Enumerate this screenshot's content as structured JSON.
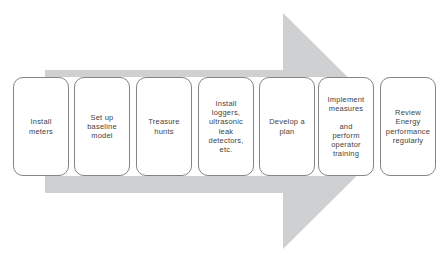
{
  "diagram": {
    "type": "process-flow-arrow",
    "direction": "right",
    "arrow_color": "#cfd0d1",
    "box_fill": "#ffffff",
    "box_border_color": "#848484",
    "text_color": "#3f3f3f",
    "steps": [
      {
        "label": "Install meters",
        "lines": [
          "Install",
          "meters"
        ]
      },
      {
        "label": "Set up baseline model",
        "lines": [
          "Set up",
          "baseline",
          "model"
        ]
      },
      {
        "label": "Treasure hunts",
        "lines": [
          "Treasure",
          "hunts"
        ]
      },
      {
        "label": "Install loggers, ultrasonic leak detectors, etc.",
        "lines": [
          "Install",
          "loggers,",
          "ultrasonic",
          "leak",
          "detectors,",
          "etc."
        ]
      },
      {
        "label": "Develop a plan",
        "lines": [
          "Develop a",
          "plan"
        ]
      },
      {
        "label": "Implement measures and perform operator training",
        "lines": [
          "Implement",
          "measures",
          "",
          "and",
          "perform",
          "operator",
          "training"
        ]
      },
      {
        "label": "Review Energy performance regularly",
        "lines": [
          "Review",
          "Energy",
          "performance",
          "regularly"
        ]
      }
    ]
  }
}
